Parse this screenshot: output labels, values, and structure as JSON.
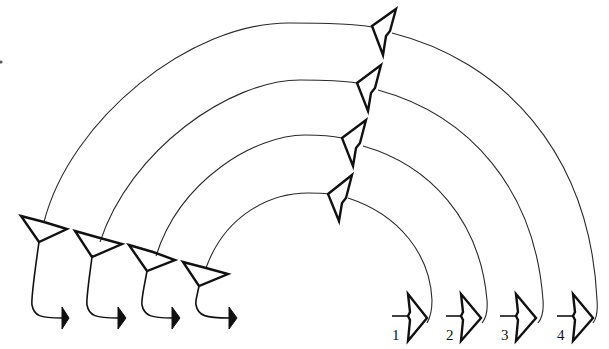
{
  "diagram": {
    "type": "neuron-circuit",
    "input_neurons": [
      {
        "id": "in-1"
      },
      {
        "id": "in-2"
      },
      {
        "id": "in-3"
      },
      {
        "id": "in-4"
      }
    ],
    "relay_neurons": [
      {
        "id": "relay-outer"
      },
      {
        "id": "relay-2"
      },
      {
        "id": "relay-3"
      },
      {
        "id": "relay-inner"
      }
    ],
    "output_neurons": [
      {
        "id": "out-1",
        "label": "1"
      },
      {
        "id": "out-2",
        "label": "2"
      },
      {
        "id": "out-3",
        "label": "3"
      },
      {
        "id": "out-4",
        "label": "4"
      }
    ],
    "colors": {
      "line": "#2a2a2a",
      "cell": "#111111",
      "background": "#ffffff"
    }
  }
}
